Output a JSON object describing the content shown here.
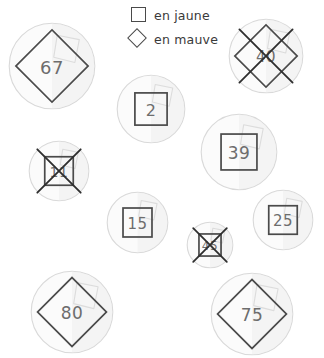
{
  "legend": {
    "items": [
      {
        "glyph": "square-icon",
        "label": "en jaune"
      },
      {
        "glyph": "diamond-icon",
        "label": "en mauve"
      }
    ]
  },
  "stickers": [
    {
      "id": "sticker-67",
      "number": "67",
      "shape": "diamond",
      "crossed": false,
      "x": 8,
      "y": 22,
      "size": 88,
      "font": 18
    },
    {
      "id": "sticker-40",
      "number": "40",
      "shape": "diamond",
      "crossed": true,
      "x": 228,
      "y": 18,
      "size": 76,
      "font": 15
    },
    {
      "id": "sticker-2",
      "number": "2",
      "shape": "square",
      "crossed": false,
      "x": 116,
      "y": 74,
      "size": 70,
      "font": 16
    },
    {
      "id": "sticker-39",
      "number": "39",
      "shape": "square",
      "crossed": false,
      "x": 200,
      "y": 113,
      "size": 78,
      "font": 17
    },
    {
      "id": "sticker-11",
      "number": "11",
      "shape": "square",
      "crossed": true,
      "x": 28,
      "y": 140,
      "size": 62,
      "font": 14
    },
    {
      "id": "sticker-15",
      "number": "15",
      "shape": "square",
      "crossed": false,
      "x": 106,
      "y": 191,
      "size": 63,
      "font": 15
    },
    {
      "id": "sticker-25",
      "number": "25",
      "shape": "square",
      "crossed": false,
      "x": 252,
      "y": 189,
      "size": 62,
      "font": 15
    },
    {
      "id": "sticker-45",
      "number": "45",
      "shape": "square",
      "crossed": true,
      "x": 186,
      "y": 221,
      "size": 48,
      "font": 12
    },
    {
      "id": "sticker-80",
      "number": "80",
      "shape": "diamond",
      "crossed": false,
      "x": 30,
      "y": 270,
      "size": 84,
      "font": 17
    },
    {
      "id": "sticker-75",
      "number": "75",
      "shape": "diamond",
      "crossed": false,
      "x": 210,
      "y": 272,
      "size": 84,
      "font": 17
    }
  ],
  "colors": {
    "ink": "#4a4a4a",
    "number_ink": "#6d6d6d",
    "disc_fill": "#fbfbfb",
    "disc_stroke": "#d9d9d9",
    "cross_stroke": "#2e2e2e",
    "background": "#ffffff"
  }
}
